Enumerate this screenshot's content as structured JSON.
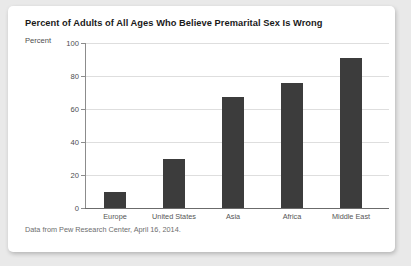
{
  "card": {
    "title": "Percent of Adults of All Ages Who Believe Premarital Sex Is Wrong",
    "caption": "Data from Pew Research Center, April 16, 2014."
  },
  "chart_data": {
    "type": "bar",
    "title": "Percent of Adults of All Ages Who Believe Premarital Sex Is Wrong",
    "subtitle": "",
    "xlabel": "",
    "ylabel": "Percent",
    "categories": [
      "Europe",
      "United States",
      "Asia",
      "Africa",
      "Middle East"
    ],
    "values": [
      10,
      30,
      67,
      76,
      91
    ],
    "ylim": [
      0,
      100
    ],
    "yticks": [
      0,
      20,
      40,
      60,
      80,
      100
    ],
    "ytick_labels": [
      "0",
      "20",
      "40",
      "60",
      "80",
      "100"
    ],
    "grid": true,
    "legend": false,
    "legend_position": "none",
    "bar_color": "#3c3c3c",
    "annotation": "Data from Pew Research Center, April 16, 2014."
  },
  "colors": {
    "page_background": "#e9e9e9",
    "card_background": "#ffffff",
    "bar": "#3c3c3c",
    "gridline": "#dedede",
    "axis": "#8c8c8c",
    "title_text": "#1a1a1a",
    "label_text": "#4d4d4d",
    "caption_text": "#6e6e6e"
  }
}
